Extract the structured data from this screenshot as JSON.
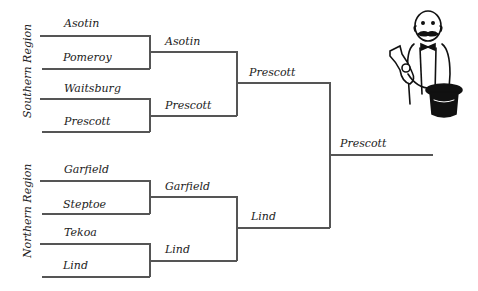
{
  "regions": {
    "southern": "Southern Region",
    "northern": "Northern Region"
  },
  "round1": {
    "southern": [
      "Asotin",
      "Pomeroy",
      "Waitsburg",
      "Prescott"
    ],
    "northern": [
      "Garfield",
      "Steptoe",
      "Tekoa",
      "Lind"
    ]
  },
  "round2": {
    "southern": [
      "Asotin",
      "Prescott"
    ],
    "northern": [
      "Garfield",
      "Lind"
    ]
  },
  "round3": {
    "southern": "Prescott",
    "northern": "Lind"
  },
  "champion": "Prescott",
  "illustration": "magician-pulling-rabbit-from-hat"
}
